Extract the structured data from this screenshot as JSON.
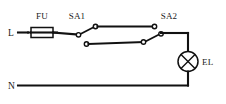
{
  "diagram": {
    "background_color": "#ffffff",
    "line_color": "#111111",
    "labels": {
      "line_terminal": "L",
      "neutral_terminal": "N",
      "fuse": "FU",
      "switch_one": "SA1",
      "switch_two": "SA2",
      "lamp": "EL"
    },
    "components": [
      {
        "name": "fuse",
        "designator": "FU",
        "symbol": "rectangle-with-through-line",
        "interactable": false
      },
      {
        "name": "switch-sa1",
        "designator": "SA1",
        "symbol": "spdt-changeover-switch",
        "position": "left",
        "blade_state": "upper-contact",
        "interactable": true
      },
      {
        "name": "switch-sa2",
        "designator": "SA2",
        "symbol": "spdt-changeover-switch",
        "position": "right",
        "blade_state": "lower-contact",
        "interactable": true
      },
      {
        "name": "lamp",
        "designator": "EL",
        "symbol": "circle-with-cross",
        "interactable": false
      }
    ],
    "nets": [
      "L to FU",
      "FU to SA1 common",
      "SA1 upper contact to SA2 upper contact",
      "SA1 lower contact to SA2 lower contact",
      "SA2 common to EL",
      "EL to N"
    ]
  }
}
